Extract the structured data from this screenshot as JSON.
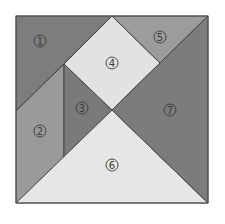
{
  "diagram": {
    "type": "tangram-square",
    "frame": {
      "x": 16,
      "y": 16,
      "width": 192,
      "height": 187,
      "border_color": "#555555"
    },
    "pieces": [
      {
        "id": 1,
        "label": "1",
        "shape": "large-triangle",
        "color": "#7d7d7d",
        "points": "16,16 112,16 16,111",
        "label_pos": [
          40,
          41
        ]
      },
      {
        "id": 2,
        "label": "2",
        "shape": "parallelogram",
        "color": "#9a9a9a",
        "points": "16,111 64,64 64,158 16,203",
        "label_pos": [
          40,
          131
        ]
      },
      {
        "id": 3,
        "label": "3",
        "shape": "small-triangle",
        "color": "#7a7a7a",
        "points": "64,64 112,110 64,158",
        "label_pos": [
          82,
          108
        ]
      },
      {
        "id": 4,
        "label": "4",
        "shape": "square",
        "color": "#e2e2e2",
        "points": "112,16 160,63 112,110 64,64",
        "label_pos": [
          112,
          63
        ]
      },
      {
        "id": 5,
        "label": "5",
        "shape": "small-triangle",
        "color": "#9c9c9c",
        "points": "112,16 208,16 160,63",
        "label_pos": [
          160,
          37
        ]
      },
      {
        "id": 6,
        "label": "6",
        "shape": "large-triangle",
        "color": "#e6e6e6",
        "points": "16,203 112,110 208,203",
        "label_pos": [
          112,
          165
        ]
      },
      {
        "id": 7,
        "label": "7",
        "shape": "large-triangle",
        "color": "#7c7c7c",
        "points": "208,16 208,203 112,110",
        "label_pos": [
          170,
          110
        ]
      }
    ]
  }
}
